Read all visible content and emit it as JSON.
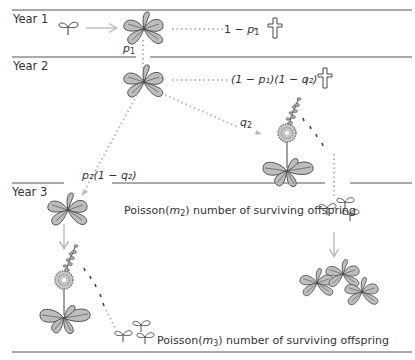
{
  "years": [
    {
      "label": "Year 1"
    },
    {
      "label": "Year 2"
    },
    {
      "label": "Year 3"
    }
  ],
  "transitions": {
    "p1": {
      "var": "p",
      "sub": "1"
    },
    "death_year1": {
      "pre": "1 − ",
      "var": "p",
      "sub": "1"
    },
    "death_year2": {
      "text": "(1 − p₁)(1 − q₂)"
    },
    "flower_year2": {
      "var": "q",
      "sub": "2"
    },
    "survive_nonflower": {
      "text": "p₂(1 − q₂)"
    }
  },
  "offspring": {
    "year2": {
      "pre": "Poisson(",
      "var": "m",
      "sub": "2",
      "post": ") number of surviving offspring"
    },
    "year3": {
      "pre": "Poisson(",
      "var": "m",
      "sub": "3",
      "post": ") number of surviving offspring"
    }
  },
  "icons": [
    "seedling-icon",
    "rosette-icon",
    "flowering-plant-icon",
    "death-cross-icon",
    "offspring-seedlings-icon"
  ],
  "colors": {
    "line": "#555555",
    "arrow": "#b5b5b5",
    "dotted": "#b5b5b5",
    "leaf_fill": "#bdbdbd",
    "leaf_stroke": "#444444"
  }
}
